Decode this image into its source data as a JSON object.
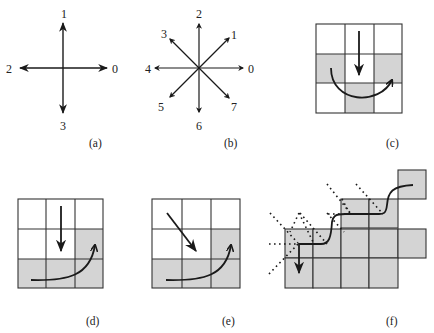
{
  "colors": {
    "stroke": "#1a1a1a",
    "grid_line": "#333333",
    "shaded_cell": "#d4d4d4",
    "background": "#ffffff"
  },
  "panels": {
    "a": {
      "caption": "(a)",
      "description": "4-connected direction codes",
      "directions": [
        {
          "code": "0",
          "dir": "right"
        },
        {
          "code": "1",
          "dir": "up"
        },
        {
          "code": "2",
          "dir": "left"
        },
        {
          "code": "3",
          "dir": "down"
        }
      ]
    },
    "b": {
      "caption": "(b)",
      "description": "8-connected direction codes",
      "directions": [
        {
          "code": "0",
          "dir": "right"
        },
        {
          "code": "1",
          "dir": "up-right"
        },
        {
          "code": "2",
          "dir": "up"
        },
        {
          "code": "3",
          "dir": "up-left"
        },
        {
          "code": "4",
          "dir": "left"
        },
        {
          "code": "5",
          "dir": "down-left"
        },
        {
          "code": "6",
          "dir": "down"
        },
        {
          "code": "7",
          "dir": "down-right"
        }
      ]
    },
    "c": {
      "caption": "(c)",
      "grid": "3x3",
      "shaded_cells": [
        [
          1,
          0
        ],
        [
          1,
          2
        ],
        [
          2,
          1
        ]
      ],
      "arrows": [
        "straight down in center column",
        "curved U-turn from left to right"
      ]
    },
    "d": {
      "caption": "(d)",
      "grid": "3x3",
      "shaded_cells": [
        [
          1,
          2
        ],
        [
          2,
          0
        ],
        [
          2,
          1
        ],
        [
          2,
          2
        ]
      ],
      "arrows": [
        "straight down in center column",
        "curved arrow along bottom row up to right"
      ]
    },
    "e": {
      "caption": "(e)",
      "grid": "3x3",
      "shaded_cells": [
        [
          1,
          2
        ],
        [
          2,
          0
        ],
        [
          2,
          1
        ],
        [
          2,
          2
        ]
      ],
      "arrows": [
        "diagonal down-right from top-left",
        "curved arrow along bottom row up to right"
      ]
    },
    "f": {
      "caption": "(f)",
      "description": "boundary tracing on staircase region of shaded cells with dotted search lines",
      "arrows": [
        "stepped contour curve ending with downward arrow"
      ]
    }
  }
}
